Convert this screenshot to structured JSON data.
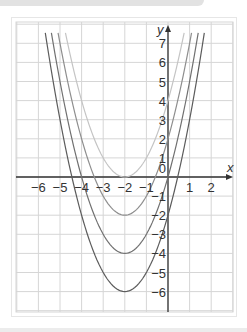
{
  "chart_data": {
    "type": "line",
    "title": "",
    "xlabel": "x",
    "ylabel": "y",
    "xlim": [
      -7,
      3
    ],
    "ylim": [
      -7.3,
      7.8
    ],
    "grid": true,
    "legend": null,
    "x_ticks": [
      "-6",
      "-5",
      "-4",
      "-3",
      "-2",
      "-1",
      "0",
      "1",
      "2"
    ],
    "y_ticks": [
      "7",
      "6",
      "5",
      "4",
      "3",
      "2",
      "1",
      "0",
      "-1",
      "-2",
      "-3",
      "-4",
      "-5",
      "-6"
    ],
    "series": [
      {
        "name": "y = (x+2)^2",
        "vertex": [
          -2,
          0
        ],
        "color": "#b8b8b8",
        "x": [
          -4.75,
          -4,
          -3,
          -2,
          -1,
          0,
          0.75
        ],
        "values": [
          7.56,
          4,
          1,
          0,
          1,
          4,
          7.56
        ]
      },
      {
        "name": "y = (x+2)^2 - 2",
        "vertex": [
          -2,
          -2
        ],
        "color": "#8a8a8a",
        "x": [
          -5,
          -4,
          -3,
          -2,
          -1,
          0,
          1
        ],
        "values": [
          7,
          2,
          -1,
          -2,
          -1,
          2,
          7
        ]
      },
      {
        "name": "y = (x+2)^2 - 4",
        "vertex": [
          -2,
          -4
        ],
        "color": "#6e6e6e",
        "x": [
          -5.3,
          -4,
          -3,
          -2,
          -1,
          0,
          1.3
        ],
        "values": [
          6.89,
          0,
          -3,
          -4,
          -3,
          0,
          6.89
        ]
      },
      {
        "name": "y = (x+2)^2 - 6",
        "vertex": [
          -2,
          -6
        ],
        "color": "#5a5a5a",
        "x": [
          -5.6,
          -4,
          -3,
          -2,
          -1,
          0,
          1.6
        ],
        "values": [
          6.96,
          -2,
          -5,
          -6,
          -5,
          -2,
          6.96
        ]
      }
    ]
  },
  "labels": {
    "x_axis": "x",
    "y_axis": "y",
    "origin": "0",
    "x_ticks": [
      {
        "text": "−6",
        "x": -6
      },
      {
        "text": "−5",
        "x": -5
      },
      {
        "text": "−4",
        "x": -4
      },
      {
        "text": "−3",
        "x": -3
      },
      {
        "text": "−2",
        "x": -2
      },
      {
        "text": "−1",
        "x": -1
      },
      {
        "text": "1",
        "x": 1
      },
      {
        "text": "2",
        "x": 2
      }
    ],
    "y_ticks": [
      {
        "text": "7",
        "y": 7
      },
      {
        "text": "6",
        "y": 6
      },
      {
        "text": "5",
        "y": 5
      },
      {
        "text": "4",
        "y": 4
      },
      {
        "text": "3",
        "y": 3
      },
      {
        "text": "2",
        "y": 2
      },
      {
        "text": "1",
        "y": 1
      },
      {
        "text": "−1",
        "y": -1
      },
      {
        "text": "−2",
        "y": -2
      },
      {
        "text": "−3",
        "y": -3
      },
      {
        "text": "−4",
        "y": -4
      },
      {
        "text": "−5",
        "y": -5
      },
      {
        "text": "−6",
        "y": -6
      }
    ]
  },
  "colors": {
    "grid": "#d6d6d6",
    "axis": "#333333",
    "curve_1": "#c4c4c4",
    "curve_2": "#8e8e8e",
    "curve_3": "#707070",
    "curve_4": "#5c5c5c"
  }
}
